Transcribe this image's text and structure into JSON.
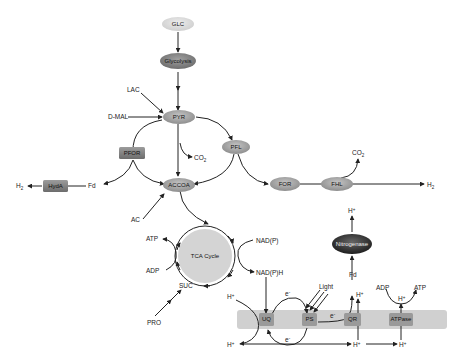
{
  "diagram": {
    "nodes": {
      "glc": "GLC",
      "glycolysis": "Glycolysis",
      "pyr": "PYR",
      "pfor": "PFOR",
      "pfl": "PFL",
      "accoa": "ACCOA",
      "hyda": "HydA",
      "for": "FOR",
      "fhl": "FHL",
      "tca": "TCA Cycle",
      "nitrogenase": "Nitrogenase",
      "uq": "UQ",
      "ps": "PS",
      "qr": "QR",
      "atpase": "ATPase"
    },
    "labels": {
      "lac": "LAC",
      "dmal": "D-MAL",
      "co2_pyr": "CO",
      "co2_pyr_sub": "2",
      "co2_fhl": "CO",
      "co2_fhl_sub": "2",
      "h2_left": "H",
      "h2_left_sub": "2",
      "h2_right": "H",
      "h2_right_sub": "2",
      "fd_left": "Fd",
      "fd_right": "Fd",
      "ac": "AC",
      "atp_tca": "ATP",
      "adp_tca": "ADP",
      "suc": "SUC",
      "pro": "PRO",
      "nadp": "NAD(P)",
      "nadph": "NAD(P)H",
      "light": "Light",
      "hplus": "H",
      "hplus_sup": "+",
      "e_minus": "e",
      "e_minus_sup": "-",
      "adp_atpase": "ADP",
      "atp_atpase": "ATP"
    },
    "colors": {
      "glc_fill": "#d8d8d8",
      "enzyme_fill": "#8a8a8a",
      "metabolite_fill": "#a8a8a8",
      "tca_fill": "#d4d4d4",
      "nitrogenase_fill": "#3a3a3a",
      "membrane_fill": "#cfcfcf",
      "membrane_box_fill": "#9a9a9a",
      "arrow": "#222222"
    }
  }
}
